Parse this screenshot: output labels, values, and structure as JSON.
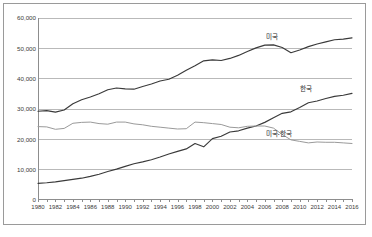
{
  "chart_data": {
    "type": "line",
    "title": "",
    "xlabel": "",
    "ylabel": "",
    "ylim": [
      0,
      60000
    ],
    "xlim": [
      1980,
      2016
    ],
    "grid": true,
    "legend_position": "inline-right",
    "ytick_labels": [
      "60,000",
      "50,000",
      "40,000",
      "30,000",
      "20,000",
      "10,000",
      "0"
    ],
    "ytick_values": [
      60000,
      50000,
      40000,
      30000,
      20000,
      10000,
      0
    ],
    "xtick_labels": [
      "1980",
      "1982",
      "1984",
      "1986",
      "1988",
      "1990",
      "1992",
      "1994",
      "1996",
      "1998",
      "2000",
      "2002",
      "2004",
      "2006",
      "2008",
      "2010",
      "2012",
      "2014",
      "2016"
    ],
    "x": [
      1980,
      1981,
      1982,
      1983,
      1984,
      1985,
      1986,
      1987,
      1988,
      1989,
      1990,
      1991,
      1992,
      1993,
      1994,
      1995,
      1996,
      1997,
      1998,
      1999,
      2000,
      2001,
      2002,
      2003,
      2004,
      2005,
      2006,
      2007,
      2008,
      2009,
      2010,
      2012,
      2011,
      2013,
      2014,
      2015,
      2016
    ],
    "series": [
      {
        "name": "미국",
        "color": "#3a3a3a",
        "label_x": 2007,
        "label_y": 54500,
        "values": [
          29100,
          29300,
          28800,
          29500,
          31600,
          32900,
          33800,
          34900,
          36200,
          36800,
          36500,
          36400,
          37300,
          38100,
          39100,
          39700,
          41000,
          42700,
          44200,
          45800,
          46100,
          45900,
          46600,
          47600,
          48900,
          50100,
          51000,
          51100,
          50200,
          48500,
          49400,
          51400,
          50500,
          52100,
          52800,
          53000,
          53400
        ]
      },
      {
        "name": "한국",
        "color": "#3a3a3a",
        "label_x": 2011,
        "label_y": 37200,
        "values": [
          5200,
          5400,
          5700,
          6100,
          6500,
          6900,
          7500,
          8200,
          9100,
          9900,
          10800,
          11700,
          12300,
          13000,
          13900,
          14900,
          15800,
          16600,
          18400,
          17300,
          20000,
          20800,
          22200,
          22600,
          23500,
          24200,
          25400,
          26900,
          28400,
          28900,
          30300,
          32500,
          31900,
          33300,
          34000,
          34400,
          35000
        ]
      },
      {
        "name": "미국-한국",
        "color": "#9a9a9a",
        "label_x": 2007,
        "label_y": 22300,
        "values": [
          24000,
          23900,
          23100,
          23400,
          25100,
          25400,
          25500,
          25000,
          24800,
          25500,
          25500,
          24900,
          24600,
          24100,
          23800,
          23500,
          23200,
          23300,
          25500,
          25300,
          25000,
          24700,
          23800,
          23600,
          24100,
          24200,
          24200,
          23500,
          21400,
          19600,
          19100,
          18900,
          18600,
          18800,
          18800,
          18600,
          18400
        ]
      }
    ]
  },
  "caption": {
    "text": ""
  }
}
